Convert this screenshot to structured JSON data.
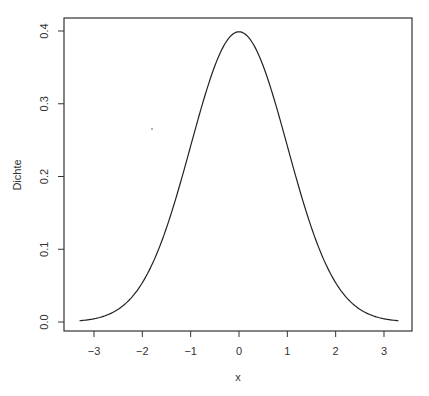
{
  "chart_data": {
    "type": "line",
    "title": "",
    "xlabel": "x",
    "ylabel": "Dichte",
    "xlim": [
      -3.3,
      3.3
    ],
    "ylim": [
      0.0,
      0.4
    ],
    "grid": false,
    "legend": null,
    "x_ticks": [
      -3,
      -2,
      -1,
      0,
      1,
      2,
      3
    ],
    "x_tick_labels": [
      "−3",
      "−2",
      "−1",
      "0",
      "1",
      "2",
      "3"
    ],
    "y_ticks": [
      0.0,
      0.1,
      0.2,
      0.3,
      0.4
    ],
    "y_tick_labels": [
      "0.0",
      "0.1",
      "0.2",
      "0.3",
      "0.4"
    ],
    "series": [
      {
        "name": "Standard normal density",
        "color": "#222222",
        "x": [
          -3.3,
          -3.0,
          -2.5,
          -2.0,
          -1.5,
          -1.0,
          -0.5,
          0.0,
          0.5,
          1.0,
          1.5,
          2.0,
          2.5,
          3.0,
          3.3
        ],
        "y": [
          0.0017,
          0.0044,
          0.0175,
          0.054,
          0.1295,
          0.242,
          0.3521,
          0.3989,
          0.3521,
          0.242,
          0.1295,
          0.054,
          0.0175,
          0.0044,
          0.0017
        ]
      }
    ]
  },
  "axes": {
    "x_label": "x",
    "y_label": "Dichte"
  }
}
